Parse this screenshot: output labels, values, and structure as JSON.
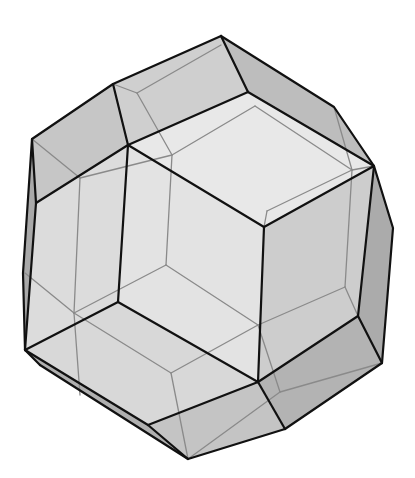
{
  "figure": {
    "colors": {
      "background": "#ffffff",
      "visible_edge": "#111111",
      "hidden_edge": "#8a8a8a",
      "face_light": "#e6e6e6",
      "face_mid": "#d2d2d2",
      "face_dark": "#b8b8b8",
      "face_darker": "#a8a8a8"
    }
  }
}
